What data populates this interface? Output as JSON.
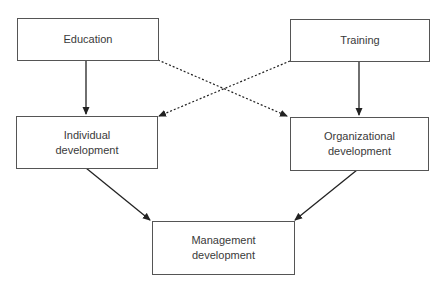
{
  "diagram": {
    "nodes": [
      {
        "id": "education",
        "lines": [
          "Education"
        ]
      },
      {
        "id": "training",
        "lines": [
          "Training"
        ]
      },
      {
        "id": "individual",
        "lines": [
          "Individual",
          "development"
        ]
      },
      {
        "id": "organizational",
        "lines": [
          "Organizational",
          "development"
        ]
      },
      {
        "id": "management",
        "lines": [
          "Management",
          "development"
        ]
      }
    ],
    "edges": [
      {
        "from": "education",
        "to": "individual",
        "style": "solid"
      },
      {
        "from": "training",
        "to": "organizational",
        "style": "solid"
      },
      {
        "from": "education",
        "to": "organizational",
        "style": "dotted"
      },
      {
        "from": "training",
        "to": "individual",
        "style": "dotted"
      },
      {
        "from": "individual",
        "to": "management",
        "style": "solid"
      },
      {
        "from": "organizational",
        "to": "management",
        "style": "solid"
      }
    ],
    "colors": {
      "line": "#222222",
      "border": "#555555",
      "text": "#3a3a3a"
    }
  }
}
